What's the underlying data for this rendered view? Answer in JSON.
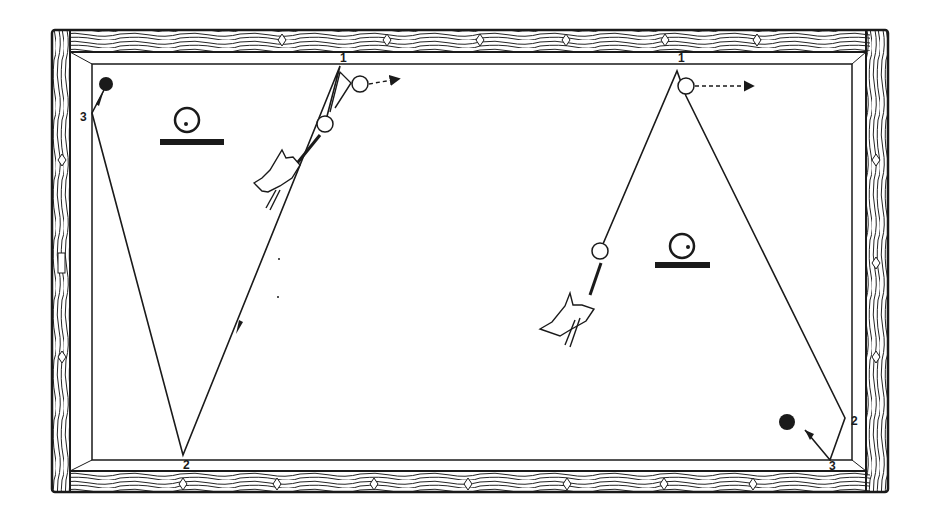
{
  "diagram": {
    "type": "billiards-shot-diagram",
    "colors": {
      "ink": "#1a1a1a",
      "cloth": "#ffffff",
      "wood_grain": "#222222"
    },
    "table": {
      "outer": [
        52,
        30,
        888,
        492
      ],
      "cloth": [
        92,
        64,
        852,
        460
      ]
    },
    "diamonds_top": [
      [
        282,
        40
      ],
      [
        387,
        40
      ],
      [
        480,
        40
      ],
      [
        566,
        40
      ],
      [
        665,
        40
      ],
      [
        757,
        40
      ]
    ],
    "diamonds_bottom": [
      [
        183,
        484
      ],
      [
        277,
        484
      ],
      [
        374,
        484
      ],
      [
        468,
        484
      ],
      [
        567,
        484
      ],
      [
        664,
        484
      ],
      [
        753,
        484
      ]
    ],
    "diamonds_left": [
      [
        62,
        160
      ],
      [
        62,
        357
      ]
    ],
    "diamonds_right": [
      [
        876,
        160
      ],
      [
        876,
        263
      ],
      [
        876,
        357
      ]
    ],
    "left_shot": {
      "labels": [
        {
          "text": "1",
          "x": 340,
          "y": 62
        },
        {
          "text": "2",
          "x": 183,
          "y": 469
        },
        {
          "text": "3",
          "x": 80,
          "y": 121
        }
      ],
      "cue_ball": [
        325,
        124
      ],
      "object_ball_after": [
        360,
        84
      ],
      "target_ball": [
        106,
        84
      ],
      "path": [
        [
          325,
          124
        ],
        [
          340,
          66
        ],
        [
          183,
          455
        ],
        [
          92,
          113
        ],
        [
          104,
          90
        ]
      ],
      "english_icon": {
        "ball": [
          187,
          120
        ],
        "base": [
          160,
          141,
          224,
          146
        ]
      }
    },
    "right_shot": {
      "labels": [
        {
          "text": "1",
          "x": 678,
          "y": 62
        },
        {
          "text": "2",
          "x": 851,
          "y": 425
        },
        {
          "text": "3",
          "x": 829,
          "y": 470
        }
      ],
      "cue_ball": [
        600,
        251
      ],
      "object_ball_after": [
        686,
        86
      ],
      "target_ball": [
        787,
        422
      ],
      "path": [
        [
          600,
          251
        ],
        [
          677,
          71
        ],
        [
          686,
          96
        ],
        [
          845,
          418
        ],
        [
          830,
          460
        ],
        [
          805,
          430
        ]
      ],
      "english_icon": {
        "ball": [
          682,
          246
        ],
        "base": [
          655,
          263,
          710,
          269
        ]
      }
    }
  }
}
